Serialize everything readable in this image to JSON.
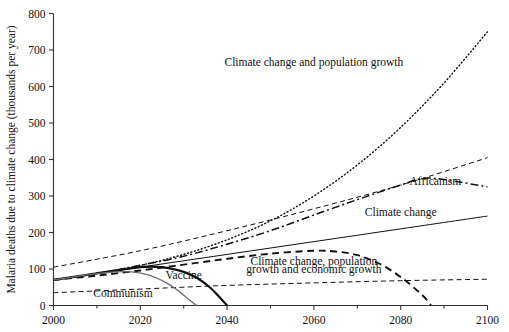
{
  "chart_data": {
    "type": "line",
    "title": "",
    "xlabel": "",
    "ylabel": "Malaria deaths due to climate change (thousands per year)",
    "xlim": [
      2000,
      2100
    ],
    "ylim": [
      0,
      800
    ],
    "grid": false,
    "legend_position": "inline-annotations",
    "x_ticks": [
      "2000",
      "2020",
      "2040",
      "2060",
      "2080",
      "2100"
    ],
    "x_tick_values": [
      2000,
      2020,
      2040,
      2060,
      2080,
      2100
    ],
    "x_minor_tick_values": [
      2010,
      2030,
      2050,
      2070,
      2090
    ],
    "y_ticks": [
      "0",
      "100",
      "200",
      "300",
      "400",
      "500",
      "600",
      "700",
      "800"
    ],
    "y_tick_values": [
      0,
      100,
      200,
      300,
      400,
      500,
      600,
      700,
      800
    ],
    "series": [
      {
        "name": "Climate change and population growth",
        "style": "dotted",
        "color": "#111111",
        "width": 1.4,
        "x": [
          2000,
          2010,
          2020,
          2030,
          2040,
          2050,
          2060,
          2070,
          2080,
          2090,
          2100
        ],
        "values": [
          70,
          88,
          110,
          140,
          180,
          232,
          300,
          385,
          488,
          610,
          750
        ]
      },
      {
        "name": "Africanism",
        "style": "dashdot",
        "color": "#111111",
        "width": 1.5,
        "x": [
          2000,
          2010,
          2020,
          2030,
          2040,
          2050,
          2060,
          2070,
          2080,
          2085,
          2090,
          2100
        ],
        "values": [
          70,
          88,
          110,
          135,
          168,
          205,
          248,
          290,
          330,
          348,
          345,
          325
        ]
      },
      {
        "name": "upper dashed envelope",
        "style": "dashed",
        "color": "#111111",
        "width": 1.0,
        "x": [
          2000,
          2020,
          2040,
          2060,
          2080,
          2100
        ],
        "values": [
          105,
          150,
          205,
          265,
          330,
          405
        ]
      },
      {
        "name": "Climate change",
        "style": "solid",
        "color": "#111111",
        "width": 1.0,
        "x": [
          2000,
          2020,
          2040,
          2060,
          2080,
          2100
        ],
        "values": [
          70,
          105,
          140,
          175,
          210,
          245
        ]
      },
      {
        "name": "Climate change, population growth and economic growth",
        "style": "dashed-heavy",
        "color": "#111111",
        "width": 1.9,
        "x": [
          2000,
          2010,
          2020,
          2030,
          2040,
          2050,
          2060,
          2065,
          2070,
          2075,
          2080,
          2085,
          2087
        ],
        "values": [
          70,
          82,
          96,
          112,
          128,
          142,
          150,
          148,
          138,
          115,
          78,
          28,
          0
        ]
      },
      {
        "name": "lower dashed baseline",
        "style": "dashed",
        "color": "#111111",
        "width": 1.0,
        "x": [
          2000,
          2020,
          2040,
          2060,
          2080,
          2100
        ],
        "values": [
          35,
          45,
          55,
          62,
          68,
          72
        ]
      },
      {
        "name": "Vaccine",
        "style": "solid-heavy",
        "color": "#111111",
        "width": 2.2,
        "x": [
          2000,
          2010,
          2020,
          2025,
          2030,
          2033,
          2036,
          2038,
          2040
        ],
        "values": [
          70,
          88,
          105,
          105,
          92,
          76,
          50,
          26,
          0
        ]
      },
      {
        "name": "Communism",
        "style": "solid-gray",
        "color": "#6e6e6e",
        "width": 1.3,
        "x": [
          2000,
          2008,
          2014,
          2018,
          2022,
          2026,
          2029,
          2031,
          2033
        ],
        "values": [
          70,
          84,
          92,
          92,
          83,
          62,
          38,
          18,
          0
        ]
      }
    ],
    "annotations": [
      {
        "text": "Climate change and population growth",
        "x": 2060,
        "y": 655
      },
      {
        "text": "Africanism",
        "x": 2088,
        "y": 330
      },
      {
        "text": "Climate change",
        "x": 2080,
        "y": 245
      },
      {
        "text": "Climate change, population",
        "x": 2060,
        "y": 112
      },
      {
        "text": "growth and economic growth",
        "x": 2060,
        "y": 90
      },
      {
        "text": "Vaccine",
        "x": 2030,
        "y": 72
      },
      {
        "text": "Communism",
        "x": 2016,
        "y": 24
      }
    ]
  }
}
